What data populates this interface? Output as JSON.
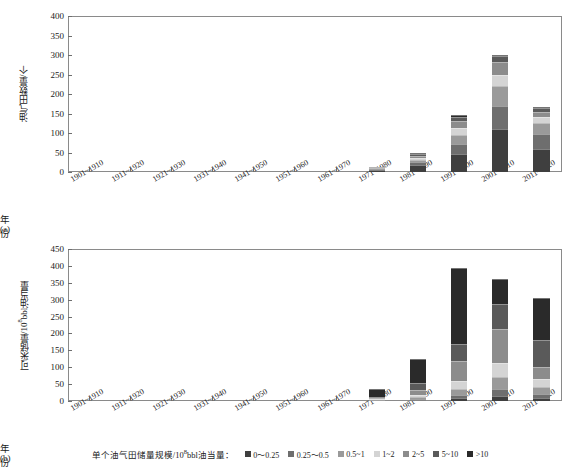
{
  "figure": {
    "width": 580,
    "height": 469,
    "background": "#ffffff"
  },
  "legend": {
    "title": "单个油气田储量规模/10",
    "title_sup": "8",
    "title_rest": "bbl油当量：",
    "items": [
      {
        "label": "0～0.25",
        "color": "#3f3f3f"
      },
      {
        "label": "0.25～0.5",
        "color": "#6e6e6e"
      },
      {
        "label": "0.5~1",
        "color": "#9a9a9a"
      },
      {
        "label": "1~2",
        "color": "#d4d4d4"
      },
      {
        "label": "2~5",
        "color": "#8c8c8c"
      },
      {
        "label": "5~10",
        "color": "#5a5a5a"
      },
      {
        "label": ">10",
        "color": "#2a2a2a"
      }
    ]
  },
  "chart_data": [
    {
      "id": "a",
      "type": "bar",
      "stacked": true,
      "title": "",
      "caption": "(a)",
      "xlabel": "年份",
      "ylabel": "油气田数量/个",
      "ylim": [
        0,
        400
      ],
      "yticks": [
        0,
        50,
        100,
        150,
        200,
        250,
        300,
        350,
        400
      ],
      "grid": false,
      "categories": [
        "1901~1910",
        "1911~1920",
        "1921~1930",
        "1931~1940",
        "1941~1950",
        "1951~1960",
        "1961~1970",
        "1971~1980",
        "1981~1990",
        "1991~2000",
        "2001~2010",
        "2011~2020"
      ],
      "series": [
        {
          "name": "0～0.25",
          "values": [
            0,
            0,
            0,
            0,
            0,
            0,
            0,
            6,
            18,
            46,
            110,
            60
          ]
        },
        {
          "name": "0.25～0.5",
          "values": [
            0,
            0,
            0,
            0,
            0,
            0,
            0,
            2,
            8,
            25,
            60,
            38
          ]
        },
        {
          "name": "0.5~1",
          "values": [
            0,
            0,
            0,
            0,
            0,
            0,
            0,
            1,
            6,
            23,
            50,
            28
          ]
        },
        {
          "name": "1~2",
          "values": [
            0,
            0,
            0,
            0,
            0,
            0,
            0,
            1,
            5,
            18,
            30,
            16
          ]
        },
        {
          "name": "2~5",
          "values": [
            0,
            0,
            0,
            0,
            0,
            0,
            0,
            1,
            5,
            18,
            32,
            12
          ]
        },
        {
          "name": "5~10",
          "values": [
            0,
            0,
            0,
            0,
            0,
            0,
            0,
            0,
            4,
            10,
            16,
            10
          ]
        },
        {
          "name": ">10",
          "values": [
            0,
            0,
            0,
            0,
            0,
            0,
            0,
            0,
            2,
            5,
            2,
            2
          ]
        }
      ],
      "totals": [
        0,
        0,
        0,
        0,
        0,
        0,
        0,
        11,
        48,
        145,
        300,
        166
      ]
    },
    {
      "id": "b",
      "type": "bar",
      "stacked": true,
      "title": "",
      "caption": "(b)",
      "xlabel": "年份",
      "ylabel": "可采储量/10",
      "ylabel_sup": "8",
      "ylabel_rest": "bbl油当量",
      "ylim": [
        0,
        450
      ],
      "yticks": [
        0,
        50,
        100,
        150,
        200,
        250,
        300,
        350,
        400,
        450
      ],
      "grid": false,
      "categories": [
        "1901~1910",
        "1911~1920",
        "1921~1930",
        "1931~1940",
        "1941~1950",
        "1951~1960",
        "1961~1970",
        "1971~1980",
        "1981~1990",
        "1991~2000",
        "2001~2010",
        "2011~2020"
      ],
      "series": [
        {
          "name": "0～0.25",
          "values": [
            0,
            0,
            0,
            0,
            0,
            0,
            0,
            1,
            3,
            8,
            14,
            8
          ]
        },
        {
          "name": "0.25～0.5",
          "values": [
            0,
            0,
            0,
            0,
            0,
            0,
            0,
            1,
            3,
            10,
            22,
            14
          ]
        },
        {
          "name": "0.5~1",
          "values": [
            0,
            0,
            0,
            0,
            0,
            0,
            0,
            1,
            5,
            17,
            35,
            20
          ]
        },
        {
          "name": "1~2",
          "values": [
            0,
            0,
            0,
            0,
            0,
            0,
            0,
            2,
            7,
            25,
            42,
            22
          ]
        },
        {
          "name": "2~5",
          "values": [
            0,
            0,
            0,
            0,
            0,
            0,
            0,
            3,
            16,
            58,
            100,
            38
          ]
        },
        {
          "name": "5~10",
          "values": [
            0,
            0,
            0,
            0,
            0,
            0,
            0,
            4,
            20,
            52,
            75,
            78
          ]
        },
        {
          "name": ">10",
          "values": [
            0,
            0,
            0,
            0,
            0,
            0,
            0,
            25,
            71,
            225,
            72,
            125
          ]
        }
      ],
      "totals": [
        0,
        0,
        0,
        0,
        0,
        0,
        0,
        37,
        125,
        395,
        360,
        305
      ]
    }
  ]
}
